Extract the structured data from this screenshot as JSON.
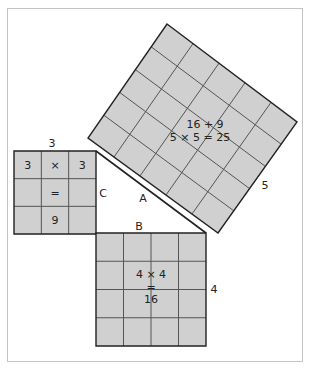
{
  "diagram": {
    "colors": {
      "fill": "#d0d0d0",
      "grid": "#555555",
      "edge": "#222222",
      "frame": "#c4c4c4",
      "text": "#222222"
    },
    "small_square": {
      "side_label": "3",
      "grid_n": 3,
      "corners": [
        [
          14,
          151
        ],
        [
          96,
          151
        ],
        [
          96,
          234
        ],
        [
          14,
          234
        ]
      ],
      "cells": [
        {
          "row": 0,
          "col": 0,
          "text": "3"
        },
        {
          "row": 0,
          "col": 1,
          "text": "×"
        },
        {
          "row": 0,
          "col": 2,
          "text": "3"
        },
        {
          "row": 1,
          "col": 1,
          "text": "="
        },
        {
          "row": 2,
          "col": 1,
          "text": "9"
        }
      ]
    },
    "medium_square": {
      "side_label": "4",
      "grid_n": 4,
      "corners": [
        [
          96,
          233
        ],
        [
          206,
          233
        ],
        [
          206,
          346
        ],
        [
          96,
          346
        ]
      ],
      "center_lines": [
        "4 × 4",
        "=",
        "16"
      ]
    },
    "large_square": {
      "side_label": "5",
      "grid_n": 5,
      "corners": [
        [
          167,
          24
        ],
        [
          297,
          122
        ],
        [
          218,
          233
        ],
        [
          88,
          138
        ]
      ],
      "center_lines": [
        "16 + 9",
        "5 × 5 = 25"
      ]
    },
    "triangle": {
      "vertices": [
        [
          96,
          151
        ],
        [
          206,
          233
        ],
        [
          96,
          233
        ]
      ],
      "labels": {
        "A": "A",
        "B": "B",
        "C": "C"
      }
    },
    "labels": [
      {
        "id": "small-side",
        "text": "3",
        "x": 52,
        "y": 147
      },
      {
        "id": "leg-c",
        "text": "C",
        "x": 103,
        "y": 197
      },
      {
        "id": "hyp-a",
        "text": "A",
        "x": 143,
        "y": 202
      },
      {
        "id": "leg-b",
        "text": "B",
        "x": 139,
        "y": 230
      },
      {
        "id": "large-side",
        "text": "5",
        "x": 265,
        "y": 189
      },
      {
        "id": "medium-side",
        "text": "4",
        "x": 214,
        "y": 293
      }
    ]
  }
}
